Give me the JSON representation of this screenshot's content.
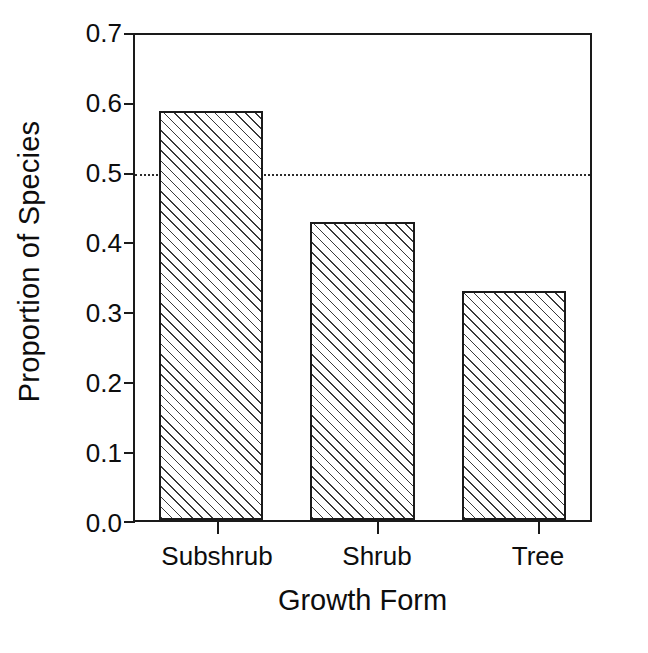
{
  "chart_data": {
    "type": "bar",
    "title": "",
    "subtitle": "",
    "xlabel": "Growth Form",
    "ylabel": "Proportion of Species",
    "categories": [
      "Subshrub",
      "Shrub",
      "Tree"
    ],
    "values": [
      0.59,
      0.43,
      0.33
    ],
    "series": [
      {
        "name": "Proportion of Species",
        "values": [
          0.59,
          0.43,
          0.33
        ]
      }
    ],
    "ylim": [
      0.0,
      0.7
    ],
    "yticks": [
      0.0,
      0.1,
      0.2,
      0.3,
      0.4,
      0.5,
      0.6,
      0.7
    ],
    "ytick_labels": [
      "0.0",
      "0.1",
      "0.2",
      "0.3",
      "0.4",
      "0.5",
      "0.6",
      "0.7"
    ],
    "xtick_labels": [
      "Subshrub",
      "Shrub",
      "Tree"
    ],
    "grid": false,
    "legend": null,
    "legend_position": "none",
    "annotations": [
      {
        "type": "horizontal-reference-line",
        "value": 0.5,
        "style": "dotted",
        "label": ""
      }
    ],
    "bar_style": {
      "fill": "diagonal-hatch",
      "edge_color": "#1a1a1a",
      "face_color": "#ffffff",
      "hatch_color": "#3a3a3a"
    },
    "colors": {
      "axis": "#1a1a1a",
      "text": "#0d0d0d",
      "background": "#ffffff",
      "refline": "#2b2b2b"
    }
  }
}
